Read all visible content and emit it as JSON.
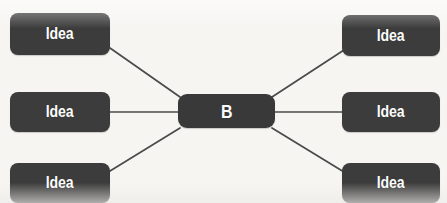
{
  "diagram": {
    "type": "mind-map",
    "background_color": "#f6f5f2",
    "node_fill_color": "#3c3c3c",
    "node_text_color": "#ffffff",
    "edge_color": "#4a4a4a",
    "center": {
      "id": "center",
      "label": "B",
      "x": 178,
      "y": 94,
      "width": 97,
      "height": 34
    },
    "branches": [
      {
        "id": "idea-top-left",
        "label": "Idea",
        "side": "left",
        "position": "top",
        "x": 10,
        "y": 13,
        "width": 100,
        "height": 42
      },
      {
        "id": "idea-middle-left",
        "label": "Idea",
        "side": "left",
        "position": "middle",
        "x": 10,
        "y": 92,
        "width": 100,
        "height": 40
      },
      {
        "id": "idea-bottom-left",
        "label": "Idea",
        "side": "left",
        "position": "bottom",
        "x": 10,
        "y": 163,
        "width": 100,
        "height": 40
      },
      {
        "id": "idea-top-right",
        "label": "Idea",
        "side": "right",
        "position": "top",
        "x": 342,
        "y": 15,
        "width": 98,
        "height": 41
      },
      {
        "id": "idea-middle-right",
        "label": "Idea",
        "side": "right",
        "position": "middle",
        "x": 342,
        "y": 92,
        "width": 98,
        "height": 40
      },
      {
        "id": "idea-bottom-right",
        "label": "Idea",
        "side": "right",
        "position": "bottom",
        "x": 342,
        "y": 163,
        "width": 98,
        "height": 40
      }
    ],
    "edges": [
      {
        "id": "edge-top-left",
        "from": "idea-top-left",
        "to": "center",
        "x1": 110,
        "y1": 48,
        "x2": 180,
        "y2": 97
      },
      {
        "id": "edge-middle-left",
        "from": "idea-middle-left",
        "to": "center",
        "x1": 110,
        "y1": 112,
        "x2": 178,
        "y2": 112
      },
      {
        "id": "edge-bottom-left",
        "from": "idea-bottom-left",
        "to": "center",
        "x1": 110,
        "y1": 171,
        "x2": 180,
        "y2": 128
      },
      {
        "id": "edge-top-right",
        "from": "center",
        "to": "idea-top-right",
        "x1": 272,
        "y1": 97,
        "x2": 344,
        "y2": 50
      },
      {
        "id": "edge-middle-right",
        "from": "center",
        "to": "idea-middle-right",
        "x1": 275,
        "y1": 112,
        "x2": 342,
        "y2": 112
      },
      {
        "id": "edge-bottom-right",
        "from": "center",
        "to": "idea-bottom-right",
        "x1": 272,
        "y1": 128,
        "x2": 344,
        "y2": 172
      }
    ]
  }
}
